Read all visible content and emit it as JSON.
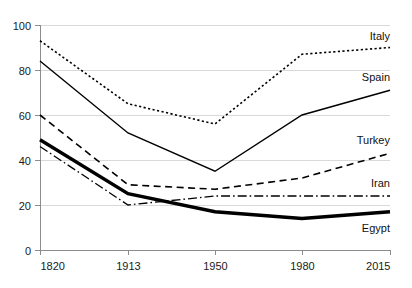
{
  "chart_data": {
    "type": "line",
    "title": "",
    "subtitle": "",
    "xlabel": "",
    "ylabel": "",
    "x": [
      1820,
      1913,
      1950,
      1980,
      2015
    ],
    "xtick_labels": [
      "1820",
      "1913",
      "1950",
      "1980",
      "2015"
    ],
    "ytick_labels": [
      "0",
      "20",
      "40",
      "60",
      "80",
      "100"
    ],
    "yticks": [
      0,
      20,
      40,
      60,
      80,
      100
    ],
    "ylim": [
      0,
      100
    ],
    "xlim": [
      1820,
      2015
    ],
    "grid": true,
    "grid_axis": "y",
    "legend_position": "right-inline-labels",
    "series": [
      {
        "name": "Italy",
        "label": "Italy",
        "style": "dotted",
        "color": "#000000",
        "width": 1.6,
        "values": [
          93,
          65,
          56,
          87,
          90
        ],
        "label_x": 2015,
        "label_y": 95
      },
      {
        "name": "Spain",
        "label": "Spain",
        "style": "solid",
        "color": "#000000",
        "width": 1.4,
        "values": [
          84,
          52,
          35,
          60,
          71
        ],
        "label_x": 2015,
        "label_y": 77
      },
      {
        "name": "Turkey",
        "label": "Turkey",
        "style": "dashed",
        "color": "#000000",
        "width": 1.6,
        "values": [
          60,
          29,
          27,
          32,
          43
        ],
        "label_x": 2015,
        "label_y": 49
      },
      {
        "name": "Iran",
        "label": "Iran",
        "style": "dashdot",
        "color": "#000000",
        "width": 1.3,
        "values": [
          46,
          20,
          24,
          24,
          24
        ],
        "label_x": 2015,
        "label_y": 30
      },
      {
        "name": "Egypt",
        "label": "Egypt",
        "style": "solid-bold",
        "color": "#000000",
        "width": 3.4,
        "values": [
          49,
          25,
          17,
          14,
          17
        ],
        "label_x": 2015,
        "label_y": 10
      }
    ]
  },
  "colors": {
    "background": "#ffffff",
    "ink": "#000000",
    "axis": "#8c8c8c",
    "grid": "#d9d9d9",
    "tick_text": "#1a1a1a"
  },
  "axes": {
    "x_tick_0": "1820",
    "x_tick_1": "1913",
    "x_tick_2": "1950",
    "x_tick_3": "1980",
    "x_tick_4": "2015",
    "y_tick_0": "0",
    "y_tick_1": "20",
    "y_tick_2": "40",
    "y_tick_3": "60",
    "y_tick_4": "80",
    "y_tick_5": "100"
  },
  "series_labels": {
    "italy": "Italy",
    "spain": "Spain",
    "turkey": "Turkey",
    "iran": "Iran",
    "egypt": "Egypt"
  }
}
